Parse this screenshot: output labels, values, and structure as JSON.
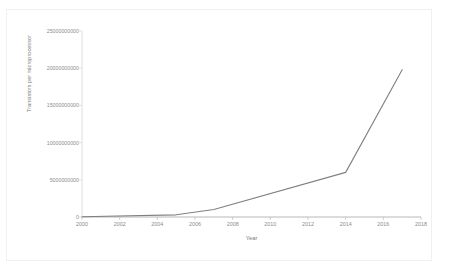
{
  "chart_data": {
    "type": "line",
    "title": "",
    "xlabel": "Year",
    "ylabel": "Transistors per microprocessor",
    "xlim": [
      2000,
      2018
    ],
    "ylim": [
      0,
      25000000000
    ],
    "grid": false,
    "legend": false,
    "legend_position": "none",
    "line_color": "#808080",
    "markers": false,
    "x_tick_labels": [
      "2000",
      "2002",
      "2004",
      "2006",
      "2008",
      "2010",
      "2012",
      "2014",
      "2016",
      "2018"
    ],
    "x_ticks": [
      2000,
      2002,
      2004,
      2006,
      2008,
      2010,
      2012,
      2014,
      2016,
      2018
    ],
    "y_tick_labels": [
      "0",
      "5000000000",
      "10000000000",
      "15000000000",
      "20000000000",
      "25000000000"
    ],
    "y_ticks": [
      0,
      5000000000,
      10000000000,
      15000000000,
      20000000000,
      25000000000
    ],
    "series": [
      {
        "name": "Transistors per microprocessor",
        "x": [
          2000,
          2005,
          2007,
          2014,
          2017
        ],
        "values": [
          42000000,
          291000000,
          1000000000,
          6000000000,
          19800000000
        ]
      }
    ]
  },
  "axis": {
    "x_title": "Year",
    "y_title": "Transistors per microprocessor"
  }
}
